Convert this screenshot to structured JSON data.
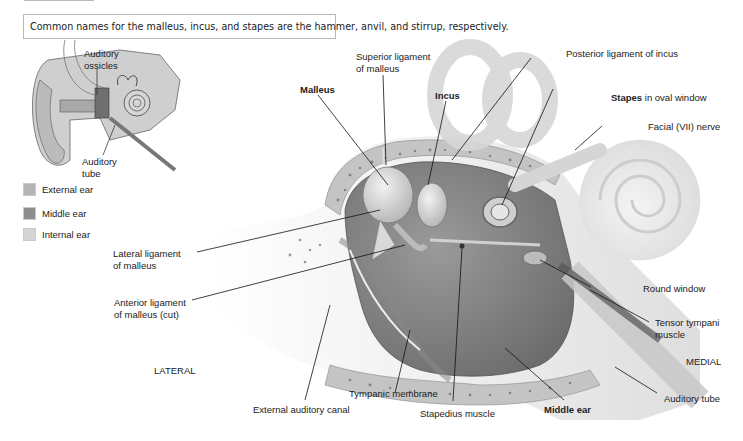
{
  "note": {
    "text": "Common names for the malleus, incus, and stapes are the hammer, anvil, and stirrup, respectively."
  },
  "inset": {
    "labels": {
      "auditory_ossicles_line1": "Auditory",
      "auditory_ossicles_line2": "ossicles",
      "auditory_tube_line1": "Auditory",
      "auditory_tube_line2": "tube"
    },
    "legend": [
      {
        "label": "External ear",
        "color": "#b4b4b4"
      },
      {
        "label": "Middle ear",
        "color": "#8e8e8e"
      },
      {
        "label": "Internal ear",
        "color": "#d4d4d4"
      }
    ]
  },
  "labels": {
    "superior_ligament_line1": "Superior ligament",
    "superior_ligament_line2": "of malleus",
    "malleus": "Malleus",
    "incus": "Incus",
    "posterior_ligament": "Posterior ligament of incus",
    "stapes_bold": "Stapes",
    "stapes_rest": " in oval window",
    "facial_nerve": "Facial (VII) nerve",
    "lateral_ligament_line1": "Lateral ligament",
    "lateral_ligament_line2": "of malleus",
    "anterior_ligament_line1": "Anterior ligament",
    "anterior_ligament_line2": "of malleus (cut)",
    "round_window": "Round window",
    "tensor_tympani_line1": "Tensor tympani",
    "tensor_tympani_line2": "muscle",
    "lateral": "LATERAL",
    "medial": "MEDIAL",
    "tympanic_membrane": "Tympanic membrane",
    "external_auditory_canal": "External auditory canal",
    "stapedius_muscle": "Stapedius muscle",
    "middle_ear": "Middle ear",
    "auditory_tube": "Auditory tube"
  }
}
